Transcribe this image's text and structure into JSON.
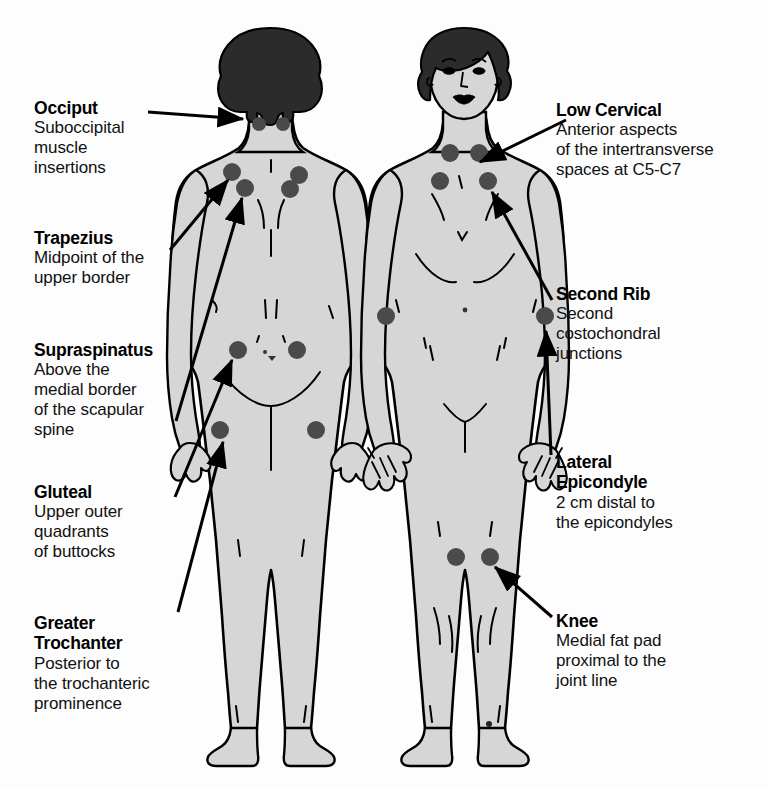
{
  "diagram": {
    "colors": {
      "body_fill": "#d6d6d6",
      "outline": "#000000",
      "hair": "#2b2b2b",
      "tender_point": "#4a4a4a",
      "text": "#000000",
      "background": "#fdfdfd"
    }
  },
  "figures": {
    "posterior": {
      "name": "posterior-view-figure",
      "label": "Posterior view"
    },
    "anterior": {
      "name": "anterior-view-figure",
      "label": "Anterior view"
    }
  },
  "callouts": {
    "left": [
      {
        "id": "occiput",
        "title": "Occiput",
        "desc_lines": [
          "Suboccipital",
          "muscle",
          "insertions"
        ]
      },
      {
        "id": "trapezius",
        "title": "Trapezius",
        "desc_lines": [
          "Midpoint of the",
          "upper border"
        ]
      },
      {
        "id": "supraspinatus",
        "title": "Supraspinatus",
        "desc_lines": [
          "Above the",
          "medial border",
          "of the scapular",
          "spine"
        ]
      },
      {
        "id": "gluteal",
        "title": "Gluteal",
        "desc_lines": [
          "Upper outer",
          "quadrants",
          "of buttocks"
        ]
      },
      {
        "id": "greater-trochanter",
        "title": "Greater",
        "title2": "Trochanter",
        "desc_lines": [
          "Posterior to",
          "the trochanteric",
          "prominence"
        ]
      }
    ],
    "right": [
      {
        "id": "low-cervical",
        "title": "Low Cervical",
        "desc_lines": [
          "Anterior aspects",
          "of the intertransverse",
          "spaces at C5-C7"
        ]
      },
      {
        "id": "second-rib",
        "title": "Second Rib",
        "desc_lines": [
          "Second",
          "costochondral",
          "junctions"
        ]
      },
      {
        "id": "lateral-epicondyle",
        "title": "Lateral",
        "title2": "Epicondyle",
        "desc_lines": [
          "2 cm distal to",
          "the epicondyles"
        ]
      },
      {
        "id": "knee",
        "title": "Knee",
        "desc_lines": [
          "Medial fat pad",
          "proximal to the",
          "joint line"
        ]
      }
    ]
  },
  "tender_points": {
    "posterior": [
      {
        "name": "occiput-left",
        "cx": 259,
        "cy": 124,
        "r": 7
      },
      {
        "name": "occiput-right",
        "cx": 283,
        "cy": 124,
        "r": 7
      },
      {
        "name": "trapezius-left",
        "cx": 232,
        "cy": 172,
        "r": 9
      },
      {
        "name": "trapezius-right",
        "cx": 299,
        "cy": 175,
        "r": 9
      },
      {
        "name": "supraspinatus-left",
        "cx": 245,
        "cy": 188,
        "r": 9
      },
      {
        "name": "supraspinatus-right",
        "cx": 290,
        "cy": 189,
        "r": 9
      },
      {
        "name": "gluteal-left",
        "cx": 238,
        "cy": 350,
        "r": 9
      },
      {
        "name": "gluteal-right",
        "cx": 297,
        "cy": 350,
        "r": 9
      },
      {
        "name": "trochanter-left",
        "cx": 220,
        "cy": 430,
        "r": 9
      },
      {
        "name": "trochanter-right",
        "cx": 316,
        "cy": 430,
        "r": 9
      }
    ],
    "anterior": [
      {
        "name": "low-cervical-left",
        "cx": 450,
        "cy": 153,
        "r": 9
      },
      {
        "name": "low-cervical-right",
        "cx": 479,
        "cy": 153,
        "r": 9
      },
      {
        "name": "second-rib-left",
        "cx": 440,
        "cy": 181,
        "r": 9
      },
      {
        "name": "second-rib-right",
        "cx": 488,
        "cy": 181,
        "r": 9
      },
      {
        "name": "lateral-epi-left",
        "cx": 386,
        "cy": 316,
        "r": 9
      },
      {
        "name": "lateral-epi-right",
        "cx": 545,
        "cy": 316,
        "r": 9
      },
      {
        "name": "knee-left",
        "cx": 456,
        "cy": 557,
        "r": 9
      },
      {
        "name": "knee-right",
        "cx": 490,
        "cy": 557,
        "r": 9
      }
    ]
  },
  "arrows": [
    {
      "name": "arrow-occiput",
      "x1": 148,
      "y1": 112,
      "x2": 243,
      "y2": 119
    },
    {
      "name": "arrow-trapezius",
      "x1": 170,
      "y1": 250,
      "x2": 228,
      "y2": 178
    },
    {
      "name": "arrow-supraspinatus",
      "x1": 176,
      "y1": 421,
      "x2": 240,
      "y2": 196
    },
    {
      "name": "arrow-gluteal",
      "x1": 175,
      "y1": 497,
      "x2": 232,
      "y2": 358
    },
    {
      "name": "arrow-trochanter",
      "x1": 178,
      "y1": 610,
      "x2": 222,
      "y2": 440
    },
    {
      "name": "arrow-low-cervical",
      "x1": 566,
      "y1": 120,
      "x2": 478,
      "y2": 162
    },
    {
      "name": "arrow-second-rib",
      "x1": 552,
      "y1": 300,
      "x2": 490,
      "y2": 192
    },
    {
      "name": "arrow-lateral-epi",
      "x1": 551,
      "y1": 455,
      "x2": 545,
      "y2": 330
    },
    {
      "name": "arrow-knee",
      "x1": 552,
      "y1": 617,
      "x2": 493,
      "y2": 566
    }
  ]
}
